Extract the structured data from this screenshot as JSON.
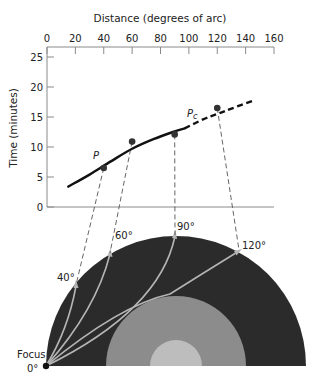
{
  "figure": {
    "x_axis_title": "Distance (degrees of arc)",
    "y_axis_title": "Time (minutes)",
    "curve_label_p": "P",
    "curve_label_pc_main": "P",
    "curve_label_pc_sub": "c",
    "focus_label": "Focus",
    "focus_angle_label": "0°",
    "ray_labels": [
      "40°",
      "60°",
      "90°",
      "120°"
    ],
    "colors": {
      "axis": "#8a8a8a",
      "curve": "#111111",
      "point": "#333333",
      "mantle": "#2b2b2b",
      "outer_core": "#8c8c8c",
      "inner_core": "#bdbdbd",
      "ray": "#b5b5b5",
      "projection": "#555555"
    }
  },
  "chart_data": {
    "type": "line",
    "title": "",
    "xlabel": "Distance (degrees of arc)",
    "ylabel": "Time (minutes)",
    "x_ticks": [
      0,
      20,
      40,
      60,
      80,
      100,
      120,
      140,
      160
    ],
    "y_ticks": [
      0,
      5,
      10,
      15,
      20,
      25
    ],
    "xlim": [
      0,
      160
    ],
    "ylim": [
      0,
      25
    ],
    "x_axis_position": "top",
    "grid": false,
    "series": [
      {
        "name": "P (solid travel-time curve)",
        "style": "solid",
        "x": [
          15,
          30,
          45,
          60,
          75,
          90,
          97
        ],
        "y": [
          3.4,
          5.4,
          7.6,
          9.7,
          11.3,
          12.6,
          13.1
        ]
      },
      {
        "name": "Pc (dashed extrapolation)",
        "style": "dashed",
        "x": [
          97,
          110,
          120,
          130,
          145
        ],
        "y": [
          13.1,
          14.6,
          15.5,
          16.4,
          17.7
        ]
      },
      {
        "name": "Observed arrivals",
        "style": "points",
        "x": [
          40,
          60,
          90,
          120
        ],
        "y": [
          6.5,
          10.9,
          12.1,
          16.5
        ]
      }
    ],
    "annotations": [
      {
        "text": "P",
        "x": 35,
        "y": 9
      },
      {
        "text": "Pc",
        "x": 103,
        "y": 15.6
      }
    ]
  }
}
